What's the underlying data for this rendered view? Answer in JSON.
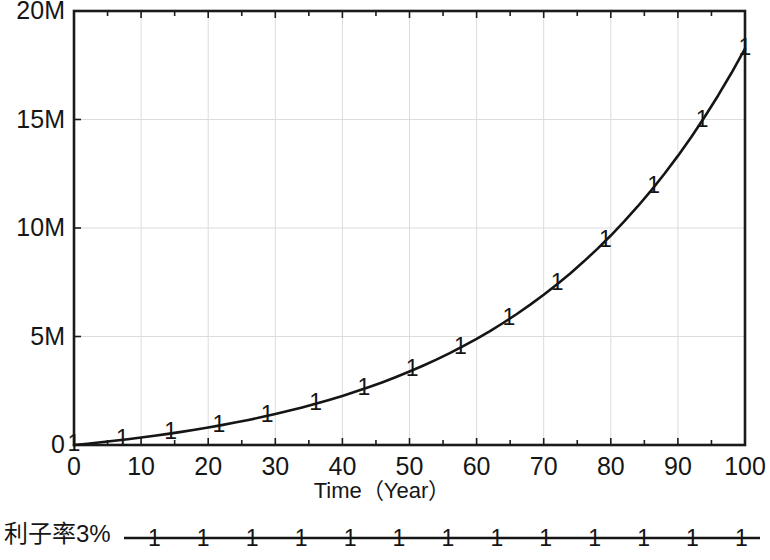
{
  "chart_data": {
    "type": "line",
    "title": "",
    "xlabel": "Time（Year）",
    "ylabel": "",
    "xlim": [
      0,
      100
    ],
    "ylim": [
      0,
      20000000
    ],
    "grid": true,
    "legend_position": "below-plot",
    "x_tick_labels": [
      "0",
      "10",
      "20",
      "30",
      "40",
      "50",
      "60",
      "70",
      "80",
      "90",
      "100"
    ],
    "x_ticks": [
      0,
      10,
      20,
      30,
      40,
      50,
      60,
      70,
      80,
      90,
      100
    ],
    "x_minor_tick_step": 5,
    "y_tick_labels": [
      "0",
      "5M",
      "10M",
      "15M",
      "20M"
    ],
    "y_ticks": [
      0,
      5000000,
      10000000,
      15000000,
      20000000
    ],
    "marker_glyph": "1",
    "marker_x": [
      0,
      7.2,
      14.4,
      21.6,
      28.8,
      36,
      43.2,
      50.4,
      57.6,
      64.8,
      72,
      79.2,
      86.4,
      93.6,
      100
    ],
    "series": [
      {
        "name": "利子率3%",
        "color": "#151515",
        "x": [
          0,
          2,
          4,
          6,
          8,
          10,
          12,
          14,
          16,
          18,
          20,
          22,
          24,
          26,
          28,
          30,
          32,
          34,
          36,
          38,
          40,
          42,
          44,
          46,
          48,
          50,
          52,
          54,
          56,
          58,
          60,
          62,
          64,
          66,
          68,
          70,
          72,
          74,
          76,
          78,
          80,
          82,
          84,
          86,
          88,
          90,
          92,
          94,
          96,
          98,
          100
        ],
        "values": [
          0,
          60900,
          125509,
          194052,
          266770,
          343916,
          425761,
          512590,
          604706,
          702433,
          806111,
          916103,
          1032794,
          1156591,
          1287926,
          1427262,
          1575085,
          1731914,
          1898299,
          2074824,
          2262108,
          2460810,
          2671627,
          2895301,
          3132618,
          3384413,
          3651570,
          3935029,
          4235786,
          4554900,
          4893494,
          5252759,
          5633960,
          6038438,
          6467616,
          6923003,
          7406200,
          7918902,
          8462910,
          9040132,
          9652595,
          10302449,
          10991975,
          11723596,
          12499881,
          13323558,
          14197525,
          15124865,
          16108852,
          17152973,
          18260940
        ]
      }
    ]
  },
  "axis_labels": {
    "y": [
      {
        "text": "20M",
        "value": 20000000
      },
      {
        "text": "15M",
        "value": 15000000
      },
      {
        "text": "10M",
        "value": 10000000
      },
      {
        "text": "5M",
        "value": 5000000
      },
      {
        "text": "0",
        "value": 0
      }
    ],
    "x": [
      {
        "text": "0",
        "value": 0
      },
      {
        "text": "10",
        "value": 10
      },
      {
        "text": "20",
        "value": 20
      },
      {
        "text": "30",
        "value": 30
      },
      {
        "text": "40",
        "value": 40
      },
      {
        "text": "50",
        "value": 50
      },
      {
        "text": "60",
        "value": 60
      },
      {
        "text": "70",
        "value": 70
      },
      {
        "text": "80",
        "value": 80
      },
      {
        "text": "90",
        "value": 90
      },
      {
        "text": "100",
        "value": 100
      }
    ]
  },
  "xaxis_title": "Time（Year）",
  "legend": {
    "label": "利子率3%",
    "marker_glyph": "1",
    "marker_count": 13,
    "line_color": "#151515"
  },
  "colors": {
    "line": "#151515",
    "frame": "#1b1b1b",
    "grid": "#dcdcdc",
    "text": "#161616",
    "background": "#ffffff"
  }
}
